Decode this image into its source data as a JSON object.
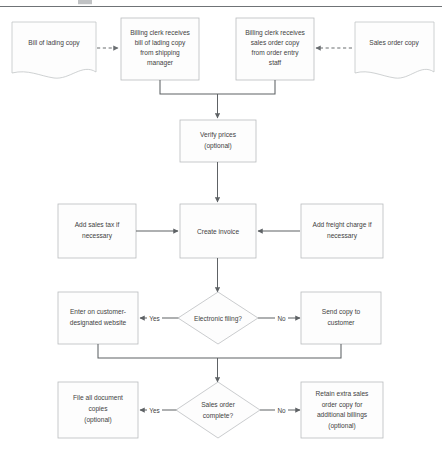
{
  "diagram": {
    "colors": {
      "shape_fill": "#fdfdfd",
      "shape_border": "#b9bcbe",
      "connector": "#5e6265",
      "text": "#3f3f3f"
    },
    "top_rule": true
  },
  "nodes": {
    "bill_of_lading_copy": {
      "type": "document",
      "lines": [
        "Bill of lading copy"
      ]
    },
    "billing_clerk_lading": {
      "type": "process",
      "lines": [
        "Billing clerk receives",
        "bill of lading copy",
        "from shipping",
        "manager"
      ]
    },
    "billing_clerk_sales_order": {
      "type": "process",
      "lines": [
        "Billing clerk receives",
        "sales order copy",
        "from order entry",
        "staff"
      ]
    },
    "sales_order_copy": {
      "type": "document",
      "lines": [
        "Sales order copy"
      ]
    },
    "verify_prices": {
      "type": "process",
      "lines": [
        "Verify prices",
        "(optional)"
      ]
    },
    "add_sales_tax": {
      "type": "process",
      "lines": [
        "Add sales tax if",
        "necessary"
      ]
    },
    "create_invoice": {
      "type": "process",
      "lines": [
        "Create invoice"
      ]
    },
    "add_freight_charge": {
      "type": "process",
      "lines": [
        "Add freight charge if",
        "necessary"
      ]
    },
    "enter_on_website": {
      "type": "process",
      "lines": [
        "Enter on customer-",
        "designated website"
      ]
    },
    "electronic_filing": {
      "type": "decision",
      "lines": [
        "Electronic filing?"
      ]
    },
    "send_copy_to_customer": {
      "type": "process",
      "lines": [
        "Send copy to",
        "customer"
      ]
    },
    "file_all_documents": {
      "type": "process",
      "lines": [
        "File all document",
        "copies",
        "(optional)"
      ]
    },
    "sales_order_complete": {
      "type": "decision",
      "lines": [
        "Sales order",
        "complete?"
      ]
    },
    "retain_extra_copy": {
      "type": "process",
      "lines": [
        "Retain extra sales",
        "order copy for",
        "additional billings",
        "(optional)"
      ]
    }
  },
  "edge_labels": {
    "electronic_filing_yes": "Yes",
    "electronic_filing_no": "No",
    "sales_order_complete_yes": "Yes",
    "sales_order_complete_no": "No"
  }
}
